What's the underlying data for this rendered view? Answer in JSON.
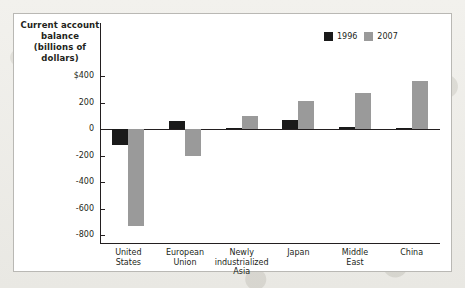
{
  "chart_data": {
    "type": "bar",
    "title": "",
    "xlabel": "",
    "ylabel": "Current account balance (billions of dollars)",
    "ylim": [
      -800,
      400
    ],
    "yticks": [
      400,
      200,
      0,
      -200,
      -400,
      -600,
      -800
    ],
    "ytick_labels": [
      "$400",
      "200",
      "0",
      "-200",
      "-400",
      "-600",
      "-800"
    ],
    "grid": false,
    "legend_position": "top-right",
    "categories": [
      "United States",
      "European Union",
      "Newly industrialized Asia",
      "Japan",
      "Middle East",
      "China"
    ],
    "category_lines": [
      [
        "United",
        "States"
      ],
      [
        "European",
        "Union"
      ],
      [
        "Newly",
        "industrialized",
        "Asia"
      ],
      [
        "Japan"
      ],
      [
        "Middle",
        "East"
      ],
      [
        "China"
      ]
    ],
    "series": [
      {
        "name": "1996",
        "color": "#1a1a1a",
        "values": [
          -120,
          60,
          5,
          65,
          15,
          10
        ]
      },
      {
        "name": "2007",
        "color": "#9a9a9a",
        "values": [
          -730,
          -205,
          100,
          210,
          270,
          360
        ]
      }
    ]
  },
  "legend": {
    "items": [
      {
        "label": "1996",
        "swatch": "black-swatch"
      },
      {
        "label": "2007",
        "swatch": "gray-swatch"
      }
    ]
  }
}
